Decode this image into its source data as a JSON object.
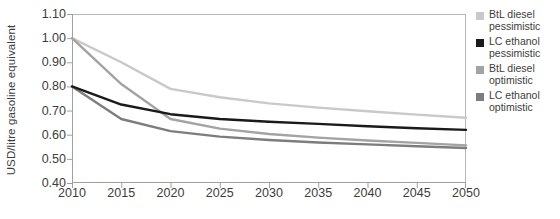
{
  "chart_data": {
    "type": "line",
    "title": "",
    "subtitle": "",
    "xlabel": "",
    "ylabel": "USD/litre gasoline equivalent",
    "x": [
      2010,
      2015,
      2020,
      2025,
      2030,
      2035,
      2040,
      2045,
      2050
    ],
    "categories": [
      "2010",
      "2015",
      "2020",
      "2025",
      "2030",
      "2035",
      "2040",
      "2045",
      "2050"
    ],
    "xlim": [
      2010,
      2050
    ],
    "ylim": [
      0.4,
      1.1
    ],
    "y_ticks": [
      "1.10",
      "1.00",
      "0.90",
      "0.80",
      "0.70",
      "0.60",
      "0.50",
      "0.40"
    ],
    "y_tick_values": [
      1.1,
      1.0,
      0.9,
      0.8,
      0.7,
      0.6,
      0.5,
      0.4
    ],
    "grid": false,
    "legend_position": "right",
    "series": [
      {
        "name": "BtL diesel pessimistic",
        "label_line1": "BtL diesel",
        "label_line2": "pessimistic",
        "color": "#c9c9c9",
        "values": [
          1.0,
          0.9,
          0.79,
          0.755,
          0.73,
          0.712,
          0.697,
          0.683,
          0.67
        ]
      },
      {
        "name": "LC ethanol pessimistic",
        "label_line1": "LC ethanol",
        "label_line2": "pessimistic",
        "color": "#1a1a1a",
        "values": [
          0.8,
          0.725,
          0.685,
          0.665,
          0.654,
          0.645,
          0.635,
          0.627,
          0.62
        ]
      },
      {
        "name": "BtL diesel optimistic",
        "label_line1": "BtL diesel",
        "label_line2": "optimistic",
        "color": "#a3a3a3",
        "values": [
          1.0,
          0.81,
          0.665,
          0.625,
          0.603,
          0.588,
          0.576,
          0.566,
          0.556
        ]
      },
      {
        "name": "LC ethanol optimistic",
        "label_line1": "LC ethanol",
        "label_line2": "optimistic",
        "color": "#7d7d7d",
        "values": [
          0.8,
          0.665,
          0.615,
          0.592,
          0.578,
          0.568,
          0.56,
          0.552,
          0.545
        ]
      }
    ]
  },
  "axes": {
    "y_title": "USD/litre gasoline equivalent",
    "axis_color": "#9b9b9b"
  },
  "legend": {
    "items": [
      {
        "label": "BtL diesel\npessimistic",
        "color": "#c9c9c9"
      },
      {
        "label": "LC ethanol\npessimistic",
        "color": "#1a1a1a"
      },
      {
        "label": "BtL diesel\noptimistic",
        "color": "#a3a3a3"
      },
      {
        "label": "LC ethanol\noptimistic",
        "color": "#7d7d7d"
      }
    ]
  }
}
